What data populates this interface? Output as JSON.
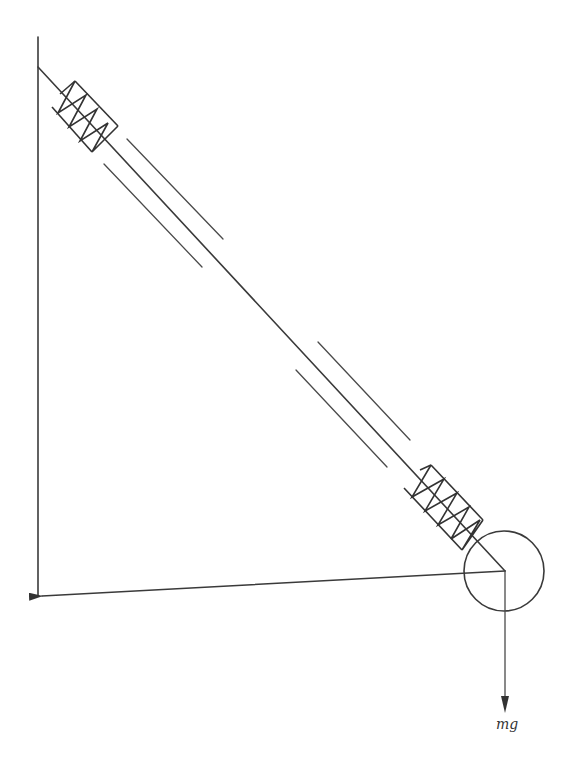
{
  "diagram": {
    "type": "physics free-body diagram",
    "labels": {
      "gravity_force": "mg"
    },
    "colors": {
      "line": "#3a3a3a",
      "background": "#ffffff"
    },
    "elements": {
      "wall": {
        "x": 38,
        "y_top": 37,
        "y_bottom": 596
      },
      "rod": {
        "from": [
          38,
          67
        ],
        "to": [
          505,
          571
        ]
      },
      "upper_spring": {
        "center": [
          85,
          116
        ],
        "coils": 3
      },
      "lower_spring": {
        "center": [
          443,
          507
        ],
        "coils": 4
      },
      "mass_circle": {
        "center": [
          504,
          571
        ],
        "radius": 40
      },
      "horizontal_force_arrow": {
        "from": [
          505,
          571
        ],
        "to": [
          40,
          596
        ]
      },
      "gravity_arrow": {
        "from": [
          505,
          571
        ],
        "to": [
          505,
          713
        ]
      }
    }
  }
}
